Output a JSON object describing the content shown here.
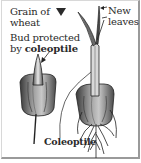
{
  "diagram": {
    "labels": {
      "grain": [
        "Grain of",
        "wheat"
      ],
      "bud_prefix": "Bud protected",
      "bud_by": "by ",
      "bud_term": "coleoptile",
      "new_leaves": [
        "New",
        "leaves"
      ],
      "coleoptile": "Coleoptile"
    },
    "icons": {
      "grain_marker": "down-triangle-icon"
    },
    "colors": {
      "frame": "#9a9a9a",
      "text": "#2a2a2a",
      "grain_dark": "#3a3a3a",
      "grain_mid": "#8a8a8a",
      "grain_light": "#d0d0d0"
    },
    "panels": [
      {
        "name": "young-seedling",
        "stage": "bud protected by coleoptile"
      },
      {
        "name": "older-seedling",
        "stage": "new leaves emerging, roots developed"
      }
    ]
  }
}
